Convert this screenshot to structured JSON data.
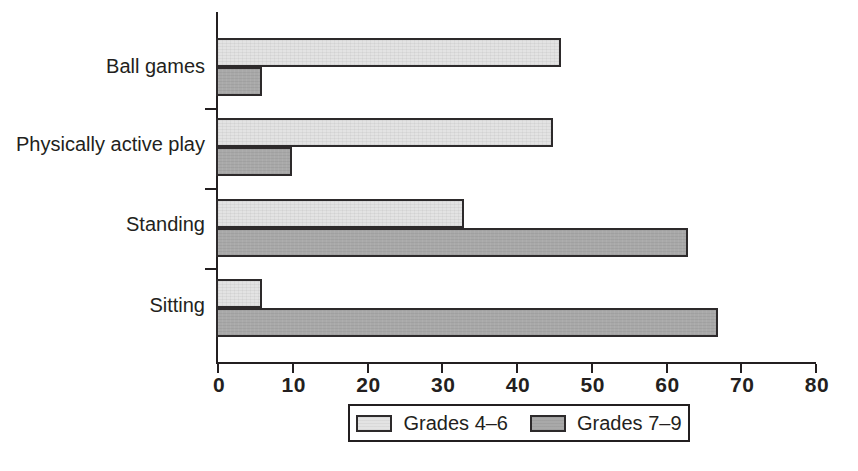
{
  "chart_data": {
    "type": "bar",
    "orientation": "horizontal",
    "title": "",
    "subtitle": "",
    "xlabel": "",
    "ylabel": "",
    "categories": [
      "Sitting",
      "Standing",
      "Physically active play",
      "Ball games"
    ],
    "series": [
      {
        "name": "Grades 4–6",
        "values": [
          6,
          33,
          45,
          46
        ],
        "color": "#e3e3e3"
      },
      {
        "name": "Grades 7–9",
        "values": [
          67,
          63,
          10,
          6
        ],
        "color": "#a9a9a9"
      }
    ],
    "xlim": [
      0,
      80
    ],
    "xticks": [
      0,
      10,
      20,
      30,
      40,
      50,
      60,
      70,
      80
    ],
    "xtick_labels": [
      "0",
      "10",
      "20",
      "30",
      "40",
      "50",
      "60",
      "70",
      "80"
    ],
    "grid": false,
    "legend_position": "bottom",
    "axis_color": "#231f20",
    "bar_border_color": "#2d2a2b",
    "background": "#ffffff"
  },
  "legend": {
    "entries": [
      {
        "label": "Grades 4–6",
        "swatch": "light-gray-swatch"
      },
      {
        "label": "Grades 7–9",
        "swatch": "dark-gray-swatch"
      }
    ]
  },
  "axis": {
    "x_tick_labels": [
      "0",
      "10",
      "20",
      "30",
      "40",
      "50",
      "60",
      "70",
      "80"
    ],
    "y_category_labels": [
      "Ball games",
      "Physically active play",
      "Standing",
      "Sitting"
    ]
  }
}
